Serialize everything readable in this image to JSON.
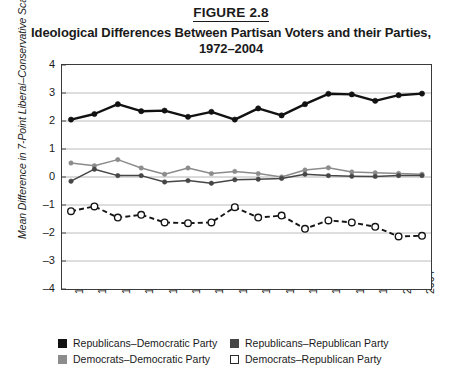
{
  "figure": {
    "number_label": "FIGURE 2.8",
    "title_line1": "Ideological Differences Between Partisan Voters and their Parties,",
    "title_line2": "1972–2004"
  },
  "axes": {
    "ylabel": "Mean Difference in 7-Point Liberal–Conservative Scale",
    "yticks": [
      "4",
      "3",
      "2",
      "1",
      "0",
      "–1",
      "–2",
      "–3",
      "–4"
    ],
    "xticks": [
      "1972",
      "1974",
      "1976",
      "1978",
      "1980",
      "1982",
      "1984",
      "1986",
      "1988",
      "1990",
      "1992",
      "1994",
      "1996",
      "1998",
      "2000",
      "2004"
    ]
  },
  "legend": {
    "items": [
      {
        "label": "Republicans–Democratic Party",
        "swatch": "sw-black",
        "color": "#121212"
      },
      {
        "label": "Republicans–Republican Party",
        "swatch": "sw-dkgray",
        "color": "#464646"
      },
      {
        "label": "Democrats–Democratic Party",
        "swatch": "sw-mdgray",
        "color": "#8c8c8c"
      },
      {
        "label": "Democrats–Republican Party",
        "swatch": "sw-white",
        "color": "#ffffff"
      }
    ]
  },
  "chart_data": {
    "type": "line",
    "title": "Ideological Differences Between Partisan Voters and their Parties, 1972–2004",
    "xlabel": "",
    "ylabel": "Mean Difference in 7-Point Liberal–Conservative Scale",
    "ylim": [
      -4,
      4
    ],
    "ytick_step": 1,
    "grid": "horizontal",
    "legend_position": "bottom",
    "categories": [
      "1972",
      "1974",
      "1976",
      "1978",
      "1980",
      "1982",
      "1984",
      "1986",
      "1988",
      "1990",
      "1992",
      "1994",
      "1996",
      "1998",
      "2000",
      "2004"
    ],
    "series": [
      {
        "name": "Republicans–Democratic Party",
        "color": "#121212",
        "style": "solid-thick",
        "marker": "filled-circle",
        "values": [
          2.05,
          2.25,
          2.6,
          2.35,
          2.37,
          2.15,
          2.33,
          2.05,
          2.45,
          2.2,
          2.6,
          2.97,
          2.95,
          2.72,
          2.92,
          2.98
        ]
      },
      {
        "name": "Democrats–Democratic Party",
        "color": "#8c8c8c",
        "style": "solid",
        "marker": "filled-circle",
        "values": [
          0.5,
          0.4,
          0.62,
          0.32,
          0.1,
          0.32,
          0.12,
          0.2,
          0.12,
          0.0,
          0.25,
          0.33,
          0.18,
          0.15,
          0.13,
          0.1
        ]
      },
      {
        "name": "Republicans–Republican Party",
        "color": "#464646",
        "style": "solid",
        "marker": "filled-circle",
        "values": [
          -0.15,
          0.28,
          0.05,
          0.05,
          -0.18,
          -0.13,
          -0.22,
          -0.1,
          -0.08,
          -0.05,
          0.1,
          0.05,
          0.03,
          0.02,
          0.05,
          0.05
        ]
      },
      {
        "name": "Democrats–Republican Party",
        "color": "#ffffff",
        "style": "dashed",
        "marker": "open-circle",
        "values": [
          -1.22,
          -1.05,
          -1.45,
          -1.35,
          -1.62,
          -1.65,
          -1.62,
          -1.08,
          -1.45,
          -1.38,
          -1.85,
          -1.55,
          -1.62,
          -1.78,
          -2.12,
          -2.1
        ]
      }
    ]
  }
}
